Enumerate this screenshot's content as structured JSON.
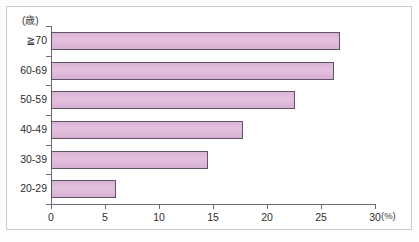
{
  "chart_data": {
    "type": "bar",
    "orientation": "horizontal",
    "title": "",
    "subtitle": "",
    "xlabel": "(%)",
    "ylabel": "(歳)",
    "categories": [
      "20-29",
      "30-39",
      "40-49",
      "50-59",
      "60-69",
      "≧70"
    ],
    "values": [
      6.0,
      14.5,
      17.8,
      22.6,
      26.2,
      26.8
    ],
    "xlim": [
      0,
      30
    ],
    "xticks": [
      0,
      5,
      10,
      15,
      20,
      25,
      30
    ],
    "xtick_labels": [
      "0",
      "5",
      "10",
      "15",
      "20",
      "25",
      "30"
    ],
    "grid": false,
    "legend": null,
    "bar_fill_color": "#ddb6d7",
    "bar_border_color": "#5d5566",
    "axis_color": "#6d6a78",
    "frame_color": "#c9c9c7"
  },
  "axes": {
    "y_unit_label": "(歳)",
    "x_unit_label": "(%)"
  }
}
